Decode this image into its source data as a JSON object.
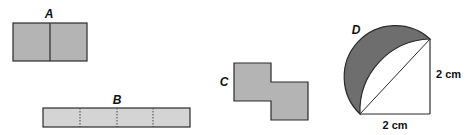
{
  "figure": {
    "shapes": [
      {
        "id": "A",
        "label": "A",
        "kind": "rectangle split into 2 squares",
        "fill": "#b4b4b4",
        "divider": "solid"
      },
      {
        "id": "B",
        "label": "B",
        "kind": "long rectangle split into 4 squares",
        "fill": "#d4d4d4",
        "divider": "dotted"
      },
      {
        "id": "C",
        "label": "C",
        "kind": "two offset squares (step shape)",
        "fill": "#b4b4b4"
      },
      {
        "id": "D",
        "label": "D",
        "kind": "square with quarter-circle arc and semicircle on diagonal; crescent shaded",
        "fill": "#6e6e6e",
        "dimensions": {
          "width_label": "2 cm",
          "height_label": "2 cm"
        }
      }
    ],
    "colors": {
      "stroke": "#2a2a2a",
      "light_fill": "#d4d4d4",
      "mid_fill": "#b4b4b4",
      "dark_fill": "#6e6e6e"
    }
  }
}
